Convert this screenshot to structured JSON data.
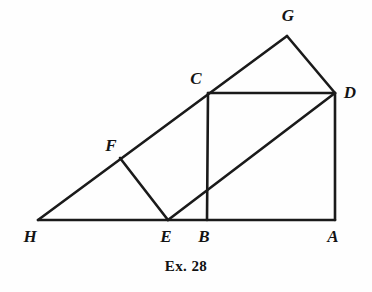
{
  "figure": {
    "caption": "Ex. 28",
    "caption_position": {
      "y": 258
    },
    "background_color": "#fefefe",
    "stroke_color": "#1a1a1a",
    "stroke_width": 2.6,
    "width": 372,
    "height": 292,
    "points": {
      "A": {
        "x": 335,
        "y": 220
      },
      "B": {
        "x": 207,
        "y": 220
      },
      "C": {
        "x": 208,
        "y": 93
      },
      "D": {
        "x": 335,
        "y": 93
      },
      "E": {
        "x": 168,
        "y": 220
      },
      "F": {
        "x": 120,
        "y": 158
      },
      "G": {
        "x": 287,
        "y": 36
      },
      "H": {
        "x": 38,
        "y": 220
      }
    },
    "labels": [
      {
        "id": "G",
        "text": "G",
        "x": 288,
        "y": 15
      },
      {
        "id": "C",
        "text": "C",
        "x": 196,
        "y": 78
      },
      {
        "id": "D",
        "text": "D",
        "x": 350,
        "y": 92
      },
      {
        "id": "F",
        "text": "F",
        "x": 111,
        "y": 145
      },
      {
        "id": "H",
        "text": "H",
        "x": 30,
        "y": 236
      },
      {
        "id": "E",
        "text": "E",
        "x": 166,
        "y": 236
      },
      {
        "id": "B",
        "text": "B",
        "x": 204,
        "y": 236
      },
      {
        "id": "A",
        "text": "A",
        "x": 333,
        "y": 236
      }
    ],
    "segments": [
      {
        "id": "base-HA",
        "from": "H",
        "to": "A"
      },
      {
        "id": "ray-HG",
        "from": "H",
        "to": "G"
      },
      {
        "id": "side-CB",
        "from": "C",
        "to": "B"
      },
      {
        "id": "side-CD",
        "from": "C",
        "to": "D"
      },
      {
        "id": "side-DA",
        "from": "D",
        "to": "A"
      },
      {
        "id": "segment-FE",
        "from": "F",
        "to": "E"
      },
      {
        "id": "diagonal-ED",
        "from": "E",
        "to": "D"
      },
      {
        "id": "segment-GD",
        "from": "G",
        "to": "D"
      }
    ]
  }
}
